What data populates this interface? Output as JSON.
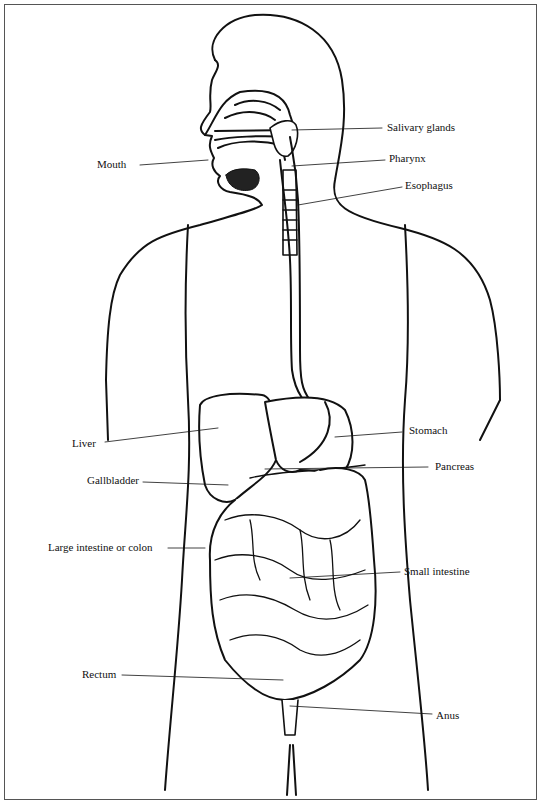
{
  "diagram": {
    "labels": {
      "salivary_glands": "Salivary glands",
      "mouth": "Mouth",
      "pharynx": "Pharynx",
      "esophagus": "Esophagus",
      "liver": "Liver",
      "stomach": "Stomach",
      "gallbladder": "Gallbladder",
      "pancreas": "Pancreas",
      "large_intestine": "Large intestine or colon",
      "small_intestine": "Small intestine",
      "rectum": "Rectum",
      "anus": "Anus"
    },
    "colors": {
      "line": "#111111",
      "background": "#ffffff",
      "frame": "#555555"
    }
  }
}
